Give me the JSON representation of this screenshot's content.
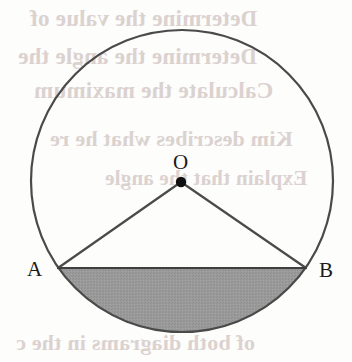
{
  "figure": {
    "background_color": "#fdfdfc",
    "stroke_color": "#4a4a4a",
    "shaded_fill_color": "#989898",
    "point_dot_color": "#101010",
    "label_color": "#1a1a1a"
  },
  "geometry": {
    "circle": {
      "center_x": 182,
      "center_y": 181,
      "radius": 151,
      "stroke_width": 2.2
    },
    "centre_point": {
      "label": "O",
      "x": 181,
      "y": 182,
      "dot_radius": 5.2
    },
    "chord": {
      "from": "A",
      "to": "B",
      "x1": 58,
      "y1": 268,
      "x2": 306,
      "y2": 268,
      "stroke_width": 2.2
    },
    "radius_OA": {
      "x1": 181,
      "y1": 182,
      "x2": 58,
      "y2": 268
    },
    "radius_OB": {
      "x1": 181,
      "y1": 182,
      "x2": 306,
      "y2": 268
    },
    "shaded_segment": {
      "description": "minor segment below chord AB",
      "chord_y": 268
    }
  },
  "labels": {
    "point_a": "A",
    "point_b": "B",
    "centre_o": "O"
  },
  "bleed_text": {
    "lines": [
      "Determine the value of",
      "Determine the angle the",
      "Calculate the maximum",
      "Kim describes what he re",
      "Explain that the angle",
      "of both diagrams in the c"
    ]
  }
}
